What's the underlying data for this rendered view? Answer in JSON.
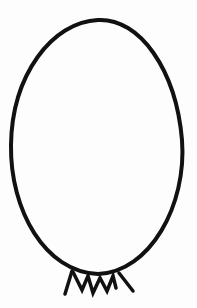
{
  "drawing": {
    "subject": "egg-shaped oval with zigzag crown of legs at base",
    "colors": {
      "background": "#fdfdfd",
      "stroke": "#111111"
    },
    "oval": {
      "cx": 97,
      "cy": 147,
      "rx": 85,
      "ry": 127,
      "stroke_width": 4
    },
    "zigzag_points": "73,272 82,290 88,276 93,293 100,278 107,291 113,276 116,288",
    "left_leg": {
      "x1": 72,
      "y1": 271,
      "x2": 65,
      "y2": 294
    },
    "right_leg": {
      "x1": 119,
      "y1": 273,
      "x2": 133,
      "y2": 291
    }
  }
}
